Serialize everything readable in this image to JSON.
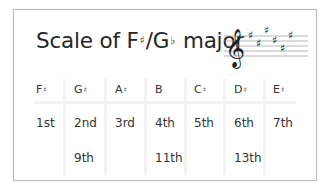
{
  "title": {
    "prefix": "Scale of F",
    "sharp": "♯",
    "slash": "/G",
    "flat": "♭",
    "suffix": " major"
  },
  "key_signature": {
    "clef": "treble-clef",
    "accidentals": [
      "♯",
      "♯",
      "♯",
      "♯",
      "♯",
      "♯"
    ],
    "count": 6
  },
  "table": {
    "columns": [
      {
        "note": "F",
        "acc": "♯",
        "degree": "1st",
        "extension": ""
      },
      {
        "note": "G",
        "acc": "♯",
        "degree": "2nd",
        "extension": "9th"
      },
      {
        "note": "A",
        "acc": "♯",
        "degree": "3rd",
        "extension": ""
      },
      {
        "note": "B",
        "acc": "",
        "degree": "4th",
        "extension": "11th"
      },
      {
        "note": "C",
        "acc": "♯",
        "degree": "5th",
        "extension": ""
      },
      {
        "note": "D",
        "acc": "♯",
        "degree": "6th",
        "extension": "13th"
      },
      {
        "note": "E",
        "acc": "♯",
        "degree": "7th",
        "extension": ""
      }
    ]
  },
  "colors": {
    "text": "#2a2a2a",
    "border": "#b9b9b9",
    "separator": "#f3f3f3",
    "background": "#ffffff"
  }
}
